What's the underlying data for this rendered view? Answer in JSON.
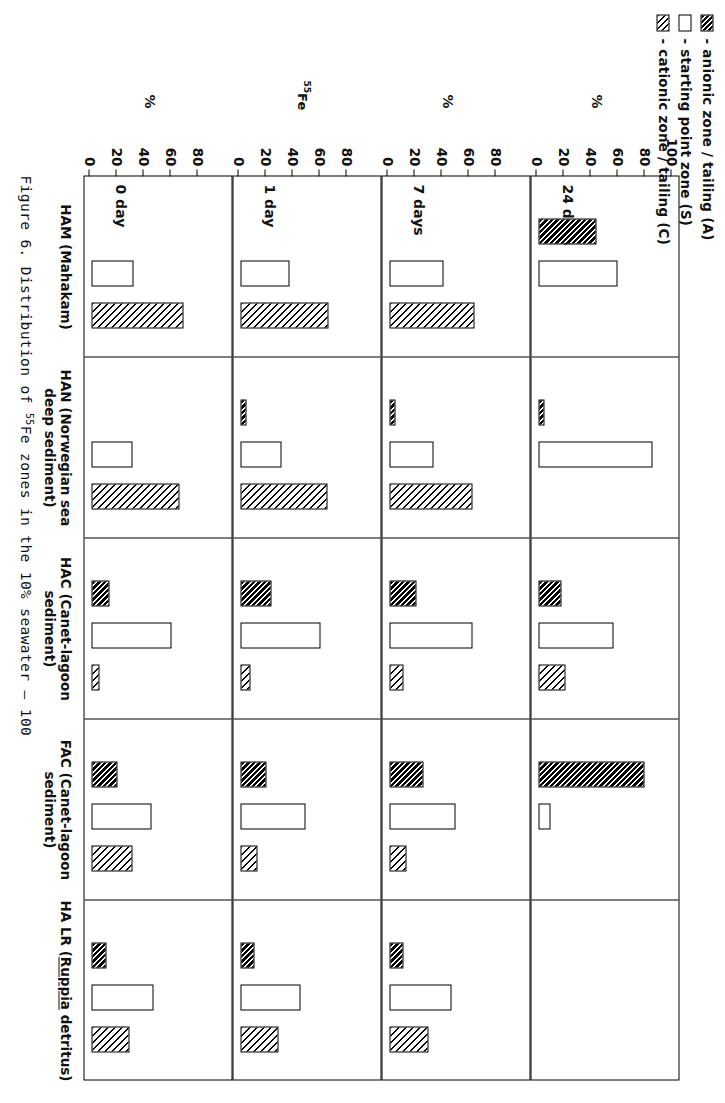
{
  "figure": {
    "caption_number": "Figure 6.",
    "caption_text_a": "Distribution of ",
    "caption_sup": "55",
    "caption_text_b": "Fe zones in the 10% seawater – 100"
  },
  "legend": {
    "items": [
      {
        "swatch": "dark-hatch-swatch",
        "dash": "-",
        "label": "anionic  zone / tailing (A)"
      },
      {
        "swatch": "white-swatch",
        "dash": "-",
        "label": "starting  point  zone (S)"
      },
      {
        "swatch": "light-hatch-swatch",
        "dash": "-",
        "label": "cationic  zone / tailing (C)"
      }
    ]
  },
  "axis": {
    "ticks": [
      0,
      20,
      40,
      60,
      80,
      100
    ],
    "tick_labels": [
      "0",
      "20",
      "40",
      "60",
      "80",
      "100"
    ],
    "percent_symbol": "%",
    "isotope_label_sup": "55",
    "isotope_label": "Fe",
    "ylim": [
      0,
      100
    ]
  },
  "rows": [
    {
      "label": "24 days",
      "show_100": true
    },
    {
      "label": "7 days",
      "show_100": false
    },
    {
      "label": "1 day",
      "show_100": false
    },
    {
      "label": "0 day",
      "show_100": false
    }
  ],
  "columns": [
    {
      "id": "HAM",
      "line1": "HAM (Mahakam)",
      "line2": "",
      "underline": ""
    },
    {
      "id": "HAN",
      "line1": "HAN (Norwegian sea",
      "line2": "deep sediment)",
      "underline": ""
    },
    {
      "id": "HAC",
      "line1": "HAC (Canet-lagoon",
      "line2": "sediment)",
      "underline": ""
    },
    {
      "id": "FAC",
      "line1": "FAC (Canet-lagoon",
      "line2": "sediment)",
      "underline": ""
    },
    {
      "id": "HALR",
      "line1": "HA LR (Ruppia detritus)",
      "line2": "",
      "underline": "Ruppia"
    }
  ],
  "chart_data": {
    "type": "bar",
    "title": "Distribution of 55Fe zones in the 10% seawater – 100",
    "xlabel": "",
    "ylabel": "%",
    "ylim": [
      0,
      100
    ],
    "grid": false,
    "legend_position": "top-left",
    "orientation": "grouped-horizontal-bars-in-panel-grid",
    "panel_rows": [
      "24 days",
      "7 days",
      "1 day",
      "0 day"
    ],
    "panel_columns": [
      "HAM (Mahakam)",
      "HAN (Norwegian sea deep sediment)",
      "HAC (Canet-lagoon sediment)",
      "FAC (Canet-lagoon sediment)",
      "HA LR (Ruppia detritus)"
    ],
    "series": [
      {
        "name": "anionic zone / tailing (A)",
        "key": "A",
        "fill": "dark-hatch"
      },
      {
        "name": "starting point zone (S)",
        "key": "S",
        "fill": "white"
      },
      {
        "name": "cationic zone / tailing (C)",
        "key": "C",
        "fill": "light-hatch"
      }
    ],
    "panels": [
      {
        "row": "24 days",
        "column": "HAM (Mahakam)",
        "values": {
          "A": 44,
          "S": 59,
          "C": 0
        }
      },
      {
        "row": "24 days",
        "column": "HAN (Norwegian sea deep sediment)",
        "values": {
          "A": 5,
          "S": 85,
          "C": 0
        }
      },
      {
        "row": "24 days",
        "column": "HAC (Canet-lagoon sediment)",
        "values": {
          "A": 18,
          "S": 56,
          "C": 21
        }
      },
      {
        "row": "24 days",
        "column": "FAC (Canet-lagoon sediment)",
        "values": {
          "A": 79,
          "S": 10,
          "C": 0
        }
      },
      {
        "row": "24 days",
        "column": "HA LR (Ruppia detritus)",
        "values": {
          "A": 0,
          "S": 0,
          "C": 0
        }
      },
      {
        "row": "7 days",
        "column": "HAM (Mahakam)",
        "values": {
          "A": 0,
          "S": 41,
          "C": 64
        }
      },
      {
        "row": "7 days",
        "column": "HAN (Norwegian sea deep sediment)",
        "values": {
          "A": 4,
          "S": 33,
          "C": 62
        }
      },
      {
        "row": "7 days",
        "column": "HAC (Canet-lagoon sediment)",
        "values": {
          "A": 21,
          "S": 62,
          "C": 11
        }
      },
      {
        "row": "7 days",
        "column": "FAC (Canet-lagoon sediment)",
        "values": {
          "A": 26,
          "S": 50,
          "C": 13
        }
      },
      {
        "row": "7 days",
        "column": "HA LR (Ruppia detritus)",
        "values": {
          "A": 11,
          "S": 47,
          "C": 30
        }
      },
      {
        "row": "1 day",
        "column": "HAM (Mahakam)",
        "values": {
          "A": 0,
          "S": 37,
          "C": 66
        }
      },
      {
        "row": "1 day",
        "column": "HAN (Norwegian sea deep sediment)",
        "values": {
          "A": 5,
          "S": 31,
          "C": 65
        }
      },
      {
        "row": "1 day",
        "column": "HAC (Canet-lagoon sediment)",
        "values": {
          "A": 24,
          "S": 60,
          "C": 8
        }
      },
      {
        "row": "1 day",
        "column": "FAC (Canet-lagoon sediment)",
        "values": {
          "A": 20,
          "S": 49,
          "C": 13
        }
      },
      {
        "row": "1 day",
        "column": "HA LR (Ruppia detritus)",
        "values": {
          "A": 11,
          "S": 45,
          "C": 29
        }
      },
      {
        "row": "0 day",
        "column": "HAM (Mahakam)",
        "values": {
          "A": 0,
          "S": 32,
          "C": 69
        }
      },
      {
        "row": "0 day",
        "column": "HAN (Norwegian sea deep sediment)",
        "values": {
          "A": 0,
          "S": 31,
          "C": 66
        }
      },
      {
        "row": "0 day",
        "column": "HAC (Canet-lagoon sediment)",
        "values": {
          "A": 14,
          "S": 60,
          "C": 7
        }
      },
      {
        "row": "0 day",
        "column": "FAC (Canet-lagoon sediment)",
        "values": {
          "A": 20,
          "S": 45,
          "C": 31
        }
      },
      {
        "row": "0 day",
        "column": "HA LR (Ruppia detritus)",
        "values": {
          "A": 12,
          "S": 47,
          "C": 29
        }
      }
    ]
  }
}
